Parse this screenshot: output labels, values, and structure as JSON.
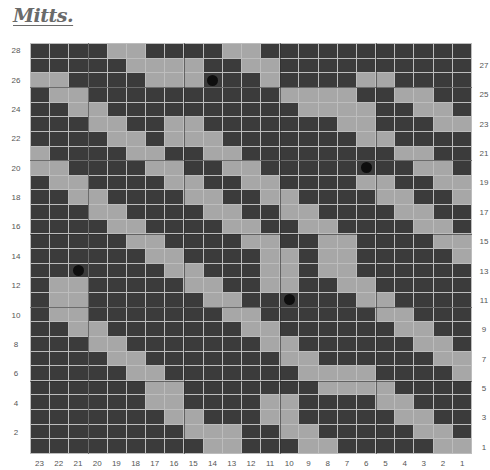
{
  "header": {
    "logo_text": "Mitts."
  },
  "chart": {
    "columns": 23,
    "rows": 28,
    "colors": {
      "dark": "#3b3b3b",
      "light": "#a7a7a7",
      "gridline": "#bdbdbd",
      "dot": "#0e0e0e"
    },
    "column_labels": [
      "23",
      "22",
      "21",
      "20",
      "19",
      "18",
      "17",
      "16",
      "15",
      "14",
      "13",
      "12",
      "11",
      "10",
      "9",
      "8",
      "7",
      "6",
      "5",
      "4",
      "3",
      "2",
      "1"
    ],
    "left_row_labels": [
      "28",
      "26",
      "24",
      "22",
      "20",
      "18",
      "16",
      "14",
      "12",
      "10",
      "8",
      "6",
      "4",
      "2"
    ],
    "right_row_labels": [
      "27",
      "25",
      "23",
      "21",
      "19",
      "17",
      "15",
      "13",
      "11",
      "9",
      "7",
      "5",
      "3",
      "1"
    ],
    "pattern_rows_top_to_bottom": [
      {
        "row": 28,
        "cells": "00001100001100000000000"
      },
      {
        "row": 27,
        "cells": "00000111100110000000000"
      },
      {
        "row": 26,
        "cells": "11000011100010000110000"
      },
      {
        "row": 25,
        "cells": "01100000000001111001100"
      },
      {
        "row": 24,
        "cells": "00110000000000111100110"
      },
      {
        "row": 23,
        "cells": "00011001100000001100011"
      },
      {
        "row": 22,
        "cells": "00001101110000000110000"
      },
      {
        "row": 21,
        "cells": "10000110011000000001100"
      },
      {
        "row": 20,
        "cells": "11000011001100000000110"
      },
      {
        "row": 19,
        "cells": "01100001100110000110011"
      },
      {
        "row": 18,
        "cells": "00110000110011000011001"
      },
      {
        "row": 17,
        "cells": "00011000011001100001100"
      },
      {
        "row": 16,
        "cells": "00001100001100110000110"
      },
      {
        "row": 15,
        "cells": "00000110000110011000011"
      },
      {
        "row": 14,
        "cells": "00000011000011011000001"
      },
      {
        "row": 13,
        "cells": "00000001100011011000000"
      },
      {
        "row": 12,
        "cells": "01100000110011001100000"
      },
      {
        "row": 11,
        "cells": "01100000011000000110000"
      },
      {
        "row": 10,
        "cells": "01100000001100000011000"
      },
      {
        "row": 9,
        "cells": "00110000000110000001100"
      },
      {
        "row": 8,
        "cells": "00011000000011000000110"
      },
      {
        "row": 7,
        "cells": "00001100000001100000011"
      },
      {
        "row": 6,
        "cells": "00000110000000111100001"
      },
      {
        "row": 5,
        "cells": "00000011000000011110000"
      },
      {
        "row": 4,
        "cells": "00000011000011000011000"
      },
      {
        "row": 3,
        "cells": "00000001100011000001100"
      },
      {
        "row": 2,
        "cells": "00000000111001100000110"
      },
      {
        "row": 1,
        "cells": "00000000011000110000011"
      }
    ],
    "dots": [
      {
        "row": 26,
        "column": 14
      },
      {
        "row": 20,
        "column": 6
      },
      {
        "row": 13,
        "column": 21
      },
      {
        "row": 11,
        "column": 10
      }
    ],
    "major_line_every": 5
  }
}
